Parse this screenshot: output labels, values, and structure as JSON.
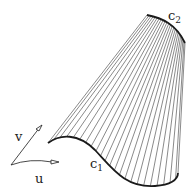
{
  "diagram": {
    "labels": {
      "c1": {
        "base": "c",
        "sub": "1"
      },
      "c2": {
        "base": "c",
        "sub": "2"
      },
      "u": "u",
      "v": "v"
    },
    "ruling_count": 24,
    "colors": {
      "stroke": "#1a1a1a",
      "ruling": "#3a3a3a",
      "background": "#ffffff"
    }
  }
}
